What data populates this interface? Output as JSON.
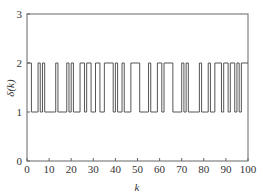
{
  "chart_data": {
    "type": "line",
    "step": true,
    "title": "",
    "xlabel": "k",
    "ylabel": "δ(k)",
    "xlim": [
      0,
      100
    ],
    "ylim": [
      0,
      3
    ],
    "xticks": [
      0,
      10,
      20,
      30,
      40,
      50,
      60,
      70,
      80,
      90,
      100
    ],
    "yticks": [
      0,
      1,
      2,
      3
    ],
    "grid": false,
    "legend": null,
    "series": [
      {
        "name": "δ(k)",
        "color": "#555555",
        "high_intervals": [
          [
            0,
            2
          ],
          [
            5,
            6
          ],
          [
            7,
            8
          ],
          [
            13,
            14
          ],
          [
            18,
            19
          ],
          [
            20,
            21
          ],
          [
            24,
            26
          ],
          [
            27,
            29
          ],
          [
            31,
            33
          ],
          [
            35,
            39
          ],
          [
            40,
            41
          ],
          [
            43,
            44
          ],
          [
            47,
            51
          ],
          [
            55,
            56
          ],
          [
            59,
            61
          ],
          [
            62,
            66
          ],
          [
            70,
            71
          ],
          [
            72,
            73
          ],
          [
            78,
            79
          ],
          [
            82,
            83
          ],
          [
            85,
            88
          ],
          [
            89,
            91
          ],
          [
            92,
            94
          ],
          [
            95,
            96
          ],
          [
            97,
            100
          ]
        ],
        "low_value": 1,
        "high_value": 2
      }
    ]
  }
}
